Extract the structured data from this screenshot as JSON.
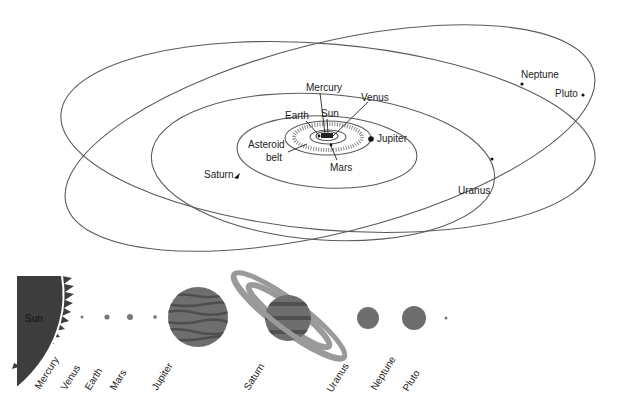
{
  "orbit_diagram": {
    "labels": {
      "mercury": "Mercury",
      "venus": "Venus",
      "earth": "Earth",
      "sun": "Sun",
      "mars": "Mars",
      "jupiter": "Jupiter",
      "asteroid_line1": "Asteroid",
      "asteroid_line2": "belt",
      "saturn": "Saturn",
      "uranus": "Uranus",
      "neptune": "Neptune",
      "pluto": "Pluto"
    }
  },
  "size_comparison": {
    "sun_label": "Sun",
    "planets": [
      {
        "name": "Mercury"
      },
      {
        "name": "Venus"
      },
      {
        "name": "Earth"
      },
      {
        "name": "Mars"
      },
      {
        "name": "Jupiter"
      },
      {
        "name": "Saturn"
      },
      {
        "name": "Uranus"
      },
      {
        "name": "Neptune"
      },
      {
        "name": "Pluto"
      }
    ]
  },
  "colors": {
    "orbit_line": "#5a5a5a",
    "sun_fill": "#3d3d3d",
    "planet_fill": "#6e6e6e",
    "ring_fill": "#9a9a9a"
  }
}
